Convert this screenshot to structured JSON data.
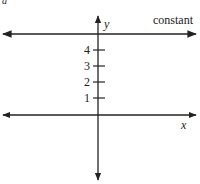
{
  "diagram": {
    "type": "coordinate-plane",
    "axes": {
      "x_label": "x",
      "y_label": "y"
    },
    "y_ticks": [
      "1",
      "2",
      "3",
      "4"
    ],
    "line_label": "constant",
    "line_color": "#222222",
    "partial_glyph_top_left": "a"
  }
}
